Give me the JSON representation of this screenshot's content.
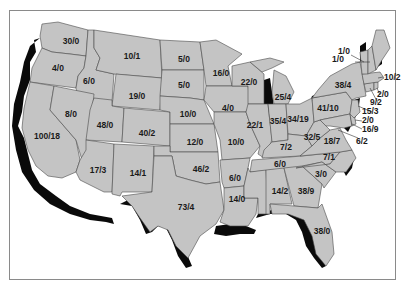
{
  "map": {
    "type": "choropleth-like outline map",
    "region": "Contiguous United States",
    "colors": {
      "state_fill": "#c4c4c4",
      "state_border": "#4a4a4a",
      "coastal_highlight": "#0a0a0a",
      "background": "#ffffff",
      "frame": "#8a8a8a"
    },
    "label_format": "a/b",
    "states": {
      "WA": "30/0",
      "OR": "4/0",
      "ID": "6/0",
      "MT": "10/1",
      "ND": "5/0",
      "SD": "5/0",
      "WY": "19/0",
      "NV": "8/0",
      "CA": "100/18",
      "UT": "48/0",
      "CO": "40/2",
      "NE": "10/0",
      "KS": "12/0",
      "AZ": "17/3",
      "NM": "14/1",
      "OK": "46/2",
      "TX": "73/4",
      "MN": "16/0",
      "IA": "4/0",
      "MO": "10/0",
      "AR": "6/0",
      "LA": "14/0",
      "WI": "22/0",
      "IL": "22/1",
      "MI": "25/4",
      "IN": "35/4",
      "OH": "34/19",
      "KY": "7/2",
      "TN": "6/0",
      "MS": "14/2",
      "AL": "38/9",
      "GA": "3/0",
      "FL": "38/0",
      "SC": "3/0",
      "NC": "7/1",
      "VA": "18/7",
      "WV": "32/5",
      "PA": "41/10",
      "NY": "38/4",
      "VT": "1/0",
      "NH": "1/0",
      "MA": "10/2",
      "RI": "2/0",
      "CT": "9/2",
      "NJ": "15/3",
      "DE": "2/0",
      "MD": "16/9",
      "DC": "6/2"
    }
  }
}
